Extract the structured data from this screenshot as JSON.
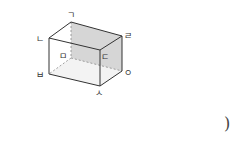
{
  "diagram": {
    "type": "rectangular-prism",
    "vertices": {
      "g": {
        "label": "ㄱ",
        "x": 71,
        "y": 22
      },
      "r": {
        "label": "ㄹ",
        "x": 122,
        "y": 36
      },
      "n": {
        "label": "ㄴ",
        "x": 49,
        "y": 38
      },
      "d": {
        "label": "ㄷ",
        "x": 100,
        "y": 50
      },
      "m": {
        "label": "ㅁ",
        "x": 71,
        "y": 58
      },
      "o": {
        "label": "ㅇ",
        "x": 122,
        "y": 71
      },
      "b": {
        "label": "ㅂ",
        "x": 49,
        "y": 74
      },
      "s": {
        "label": "ㅅ",
        "x": 100,
        "y": 86
      }
    },
    "shaded_face": [
      "ㄱ",
      "ㄹ",
      "ㅇ",
      "ㅁ"
    ],
    "hidden_edges": [
      "ㄱ-ㅁ",
      "ㅁ-ㅂ",
      "ㅁ-ㅇ"
    ],
    "colors": {
      "edge": "#333333",
      "hidden_edge": "#888888",
      "shade": "#d8d8d8",
      "bottom_shade": "#f2f2f2"
    }
  },
  "answer_blank": {
    "close_paren": ")"
  }
}
